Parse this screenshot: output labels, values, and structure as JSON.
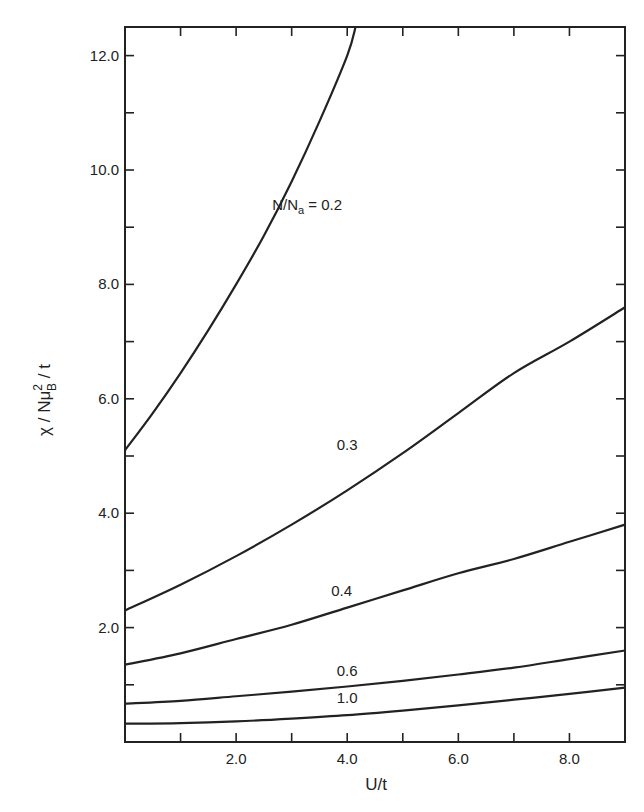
{
  "chart_data": {
    "type": "line",
    "title": "",
    "xlabel": "U/t",
    "ylabel": "χ / Nμ_B² / t",
    "xlim": [
      0,
      9.0
    ],
    "ylim": [
      0,
      12.5
    ],
    "grid": false,
    "legend": "inline curve labels",
    "x_ticks": [
      2.0,
      4.0,
      6.0,
      8.0
    ],
    "x_tick_labels": [
      "2.0",
      "4.0",
      "6.0",
      "8.0"
    ],
    "x_minor_ticks": [
      1.0,
      3.0,
      5.0,
      7.0
    ],
    "y_ticks": [
      2.0,
      4.0,
      6.0,
      8.0,
      10.0,
      12.0
    ],
    "y_tick_labels": [
      "2.0",
      "4.0",
      "6.0",
      "8.0",
      "10.0",
      "12.0"
    ],
    "y_minor_ticks": [
      1.0,
      3.0,
      5.0,
      7.0,
      9.0,
      11.0
    ],
    "series": [
      {
        "name": "N/Na = 0.2",
        "label": "N/Na = 0.2",
        "x": [
          0,
          0.5,
          1.0,
          1.5,
          2.0,
          2.5,
          3.0,
          3.5,
          4.0,
          4.15
        ],
        "y": [
          5.1,
          5.75,
          6.45,
          7.2,
          8.0,
          8.85,
          9.8,
          10.85,
          12.0,
          12.5
        ]
      },
      {
        "name": "0.3",
        "label": "0.3",
        "x": [
          0,
          1.0,
          2.0,
          3.0,
          4.0,
          5.0,
          6.0,
          7.0,
          8.0,
          9.0
        ],
        "y": [
          2.3,
          2.75,
          3.25,
          3.8,
          4.4,
          5.05,
          5.75,
          6.45,
          7.0,
          7.6
        ]
      },
      {
        "name": "0.4",
        "label": "0.4",
        "x": [
          0,
          1.0,
          2.0,
          3.0,
          4.0,
          5.0,
          6.0,
          7.0,
          8.0,
          9.0
        ],
        "y": [
          1.35,
          1.55,
          1.8,
          2.05,
          2.35,
          2.65,
          2.95,
          3.2,
          3.5,
          3.8
        ]
      },
      {
        "name": "0.6",
        "label": "0.6",
        "x": [
          0,
          1.0,
          2.0,
          3.0,
          4.0,
          5.0,
          6.0,
          7.0,
          8.0,
          9.0
        ],
        "y": [
          0.67,
          0.72,
          0.8,
          0.88,
          0.97,
          1.07,
          1.18,
          1.3,
          1.45,
          1.6
        ]
      },
      {
        "name": "1.0",
        "label": "1.0",
        "x": [
          0,
          1.0,
          2.0,
          3.0,
          4.0,
          5.0,
          6.0,
          7.0,
          8.0,
          9.0
        ],
        "y": [
          0.32,
          0.33,
          0.36,
          0.41,
          0.47,
          0.55,
          0.64,
          0.74,
          0.84,
          0.95
        ]
      }
    ],
    "annotations": [
      {
        "text": "N/Na = 0.2",
        "x": 2.65,
        "y": 9.3
      },
      {
        "text": "0.3",
        "x": 4.0,
        "y": 5.1
      },
      {
        "text": "0.4",
        "x": 3.9,
        "y": 2.55
      },
      {
        "text": "0.6",
        "x": 4.0,
        "y": 1.15
      },
      {
        "text": "1.0",
        "x": 4.0,
        "y": 0.68
      }
    ]
  },
  "axes": {
    "x_title": "U/t",
    "y_title_parts": {
      "chi": "χ",
      "slash1": " / N",
      "mu": "μ",
      "sup": "2",
      "sub": "B",
      "rest": " / t"
    }
  }
}
